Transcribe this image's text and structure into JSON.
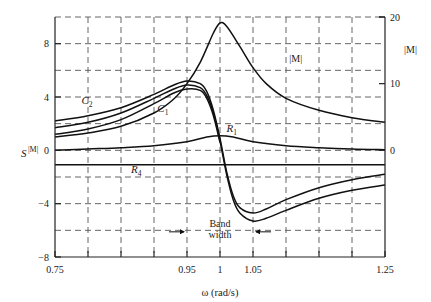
{
  "chart_data": {
    "type": "line",
    "title": "",
    "xlabel": "ω (rad/s)",
    "ylabel": "S^{|M|}",
    "ylabel_right": "|M|",
    "xlim": [
      0.75,
      1.25
    ],
    "ylim": [
      -8,
      10
    ],
    "ylim_right": [
      0,
      20
    ],
    "grid": true,
    "x_ticks": [
      0.75,
      0.95,
      1,
      1.05,
      1.25
    ],
    "x_tick_labels": [
      "0.75",
      "0.95",
      "1",
      "1.05",
      "1.25"
    ],
    "x_gridlines": [
      0.8,
      0.85,
      0.9,
      0.95,
      1.0,
      1.05,
      1.1,
      1.15,
      1.2
    ],
    "y_ticks": [
      -8,
      -4,
      0,
      4,
      8
    ],
    "y_tick_labels": [
      "−8",
      "−4",
      "0",
      "4",
      "8"
    ],
    "y_gridlines": [
      -6,
      -4,
      -2,
      0,
      2,
      4,
      6,
      8
    ],
    "y_right_ticks": [
      0,
      10,
      20
    ],
    "y_right_tick_labels": [
      "0",
      "10",
      "20"
    ],
    "series": [
      {
        "name": "|M|",
        "axis": "right",
        "x": [
          0.75,
          0.8,
          0.85,
          0.9,
          0.93,
          0.95,
          0.97,
          0.99,
          1.0,
          1.01,
          1.03,
          1.05,
          1.07,
          1.1,
          1.15,
          1.2,
          1.25
        ],
        "values": [
          2.0,
          2.6,
          3.6,
          5.6,
          7.7,
          10.0,
          13.2,
          17.6,
          19.1,
          18.6,
          15.6,
          12.4,
          10.0,
          7.8,
          6.0,
          4.9,
          4.2
        ]
      },
      {
        "name": "C2",
        "axis": "left",
        "x": [
          0.75,
          0.8,
          0.85,
          0.9,
          0.93,
          0.95,
          0.97,
          0.98,
          0.99,
          1.0,
          1.01,
          1.02,
          1.03,
          1.05,
          1.07,
          1.1,
          1.15,
          1.2,
          1.25
        ],
        "values": [
          2.2,
          2.6,
          3.2,
          4.2,
          4.9,
          5.2,
          5.0,
          4.4,
          3.0,
          0.9,
          -1.6,
          -3.4,
          -4.3,
          -4.7,
          -4.4,
          -3.7,
          -2.8,
          -2.2,
          -1.8
        ]
      },
      {
        "name": "C1",
        "axis": "left",
        "x": [
          0.75,
          0.8,
          0.85,
          0.9,
          0.93,
          0.95,
          0.97,
          0.98,
          0.99,
          1.0,
          1.01,
          1.02,
          1.03,
          1.05,
          1.07,
          1.1,
          1.15,
          1.2,
          1.25
        ],
        "values": [
          1.7,
          2.1,
          2.8,
          3.9,
          4.6,
          4.9,
          4.7,
          4.1,
          2.8,
          0.7,
          -1.8,
          -3.7,
          -4.7,
          -5.3,
          -5.1,
          -4.5,
          -3.6,
          -3.0,
          -2.6
        ]
      },
      {
        "name": "C3",
        "axis": "left",
        "x": [
          0.75,
          0.8,
          0.85,
          0.9,
          0.93,
          0.95,
          0.97,
          0.98,
          0.99,
          1.0
        ],
        "values": [
          1.2,
          1.6,
          2.3,
          3.5,
          4.3,
          4.6,
          4.5,
          3.9,
          2.6,
          0.6
        ]
      },
      {
        "name": "R1",
        "axis": "left",
        "x": [
          0.75,
          0.8,
          0.85,
          0.9,
          0.95,
          0.98,
          1.0,
          1.02,
          1.05,
          1.1,
          1.15,
          1.2,
          1.25
        ],
        "values": [
          0.0,
          0.1,
          0.2,
          0.35,
          0.65,
          1.0,
          1.1,
          1.0,
          0.65,
          0.35,
          0.2,
          0.1,
          0.05
        ]
      },
      {
        "name": "R4",
        "axis": "left",
        "x": [
          0.75,
          1.25
        ],
        "values": [
          -1.08,
          -1.08
        ]
      }
    ],
    "annotations": [
      {
        "text": "C",
        "sub": "2",
        "x": 0.79,
        "y": 3.5
      },
      {
        "text": "C",
        "sub": "1",
        "x": 0.905,
        "y": 2.85
      },
      {
        "text": "R",
        "sub": "1",
        "x": 1.01,
        "y": 1.4
      },
      {
        "text": "R",
        "sub": "4",
        "x": 0.865,
        "y": -1.7
      },
      {
        "text": "|M|",
        "x": 1.105,
        "y": 6.6
      },
      {
        "text": "Band",
        "x": 1.0,
        "y": -5.75
      },
      {
        "text": "width",
        "x": 1.0,
        "y": -6.6
      }
    ],
    "bandwidth": {
      "from": 0.95,
      "to": 1.05,
      "label": "Band width"
    }
  }
}
